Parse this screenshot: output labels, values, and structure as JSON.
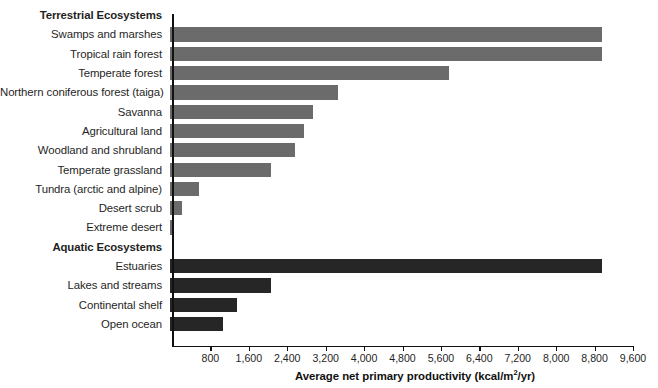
{
  "chart_data": {
    "type": "bar",
    "orientation": "horizontal",
    "title": "",
    "xlabel": "Average net primary productivity (kcal/m²/yr)",
    "ylabel": "",
    "xlim": [
      0,
      9600
    ],
    "xticks": [
      800,
      1600,
      2400,
      3200,
      4000,
      4800,
      5600,
      6400,
      7200,
      8000,
      8800,
      9600
    ],
    "xtick_labels": [
      "800",
      "1,600",
      "2,400",
      "3,200",
      "4,000",
      "4,800",
      "5,600",
      "6,400",
      "7,200",
      "8,000",
      "8,800",
      "9,600"
    ],
    "grid": false,
    "legend": "none",
    "groups": [
      {
        "name": "Terrestrial Ecosystems",
        "color": "#6b6b6b",
        "categories": [
          "Swamps and marshes",
          "Tropical rain forest",
          "Temperate forest",
          "Northern coniferous forest (taiga)",
          "Savanna",
          "Agricultural land",
          "Woodland and shrubland",
          "Temperate grassland",
          "Tundra (arctic and alpine)",
          "Desert scrub",
          "Extreme desert"
        ],
        "values": [
          9000,
          9000,
          5800,
          3500,
          2980,
          2800,
          2600,
          2100,
          600,
          250,
          70
        ]
      },
      {
        "name": "Aquatic Ecosystems",
        "color": "#262626",
        "categories": [
          "Estuaries",
          "Lakes and streams",
          "Continental shelf",
          "Open ocean"
        ],
        "values": [
          9000,
          2100,
          1400,
          1100
        ]
      }
    ]
  },
  "colors": {
    "terrestrial_bar": "#6b6b6b",
    "aquatic_bar": "#262626",
    "axis": "#111111",
    "text": "#1f1f1f",
    "background": "#ffffff"
  }
}
